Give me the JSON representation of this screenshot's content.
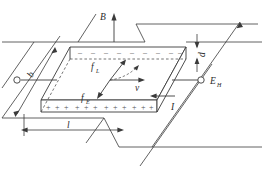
{
  "figure": {
    "stroke_color": "#3a3a3a",
    "label_color": "#2b2b2b",
    "charge_color": "#555555",
    "background": "#ffffff"
  },
  "labels": {
    "magnetic_field": "B",
    "hall_field": "E",
    "hall_field_sub": "H",
    "lorentz_force": "f",
    "lorentz_force_sub": "L",
    "electric_force": "f",
    "electric_force_sub": "E",
    "velocity": "v",
    "current": "I",
    "length": "l",
    "width": "b",
    "thickness": "d"
  },
  "charges": {
    "positive_symbol": "+",
    "positive_count": 12,
    "negative_symbol": "–",
    "negative_count": 9
  },
  "terminals": {
    "left_label": "",
    "right_label": ""
  }
}
